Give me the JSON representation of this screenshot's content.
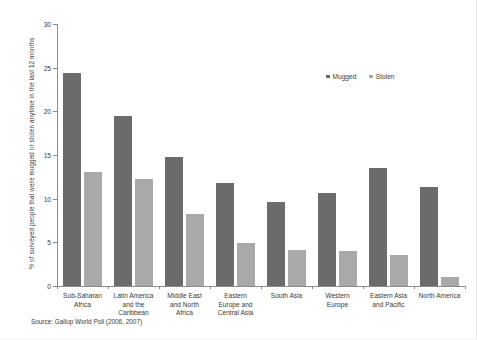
{
  "chart_data": {
    "type": "bar",
    "title": "",
    "subtitle": "",
    "xlabel": "",
    "ylabel": "% of surveyed people that were mugged or stolen anytime in the last 12 months",
    "ylim": [
      0,
      30
    ],
    "yticks": [
      0,
      5,
      10,
      15,
      20,
      25,
      30
    ],
    "ytick_labels": [
      "0",
      "5",
      "10",
      "15",
      "20",
      "25",
      "30"
    ],
    "grid": false,
    "legend_position": "top-right",
    "categories": [
      "Sub-Saharan Africa",
      "Latin America and the Caribbean",
      "Middle East and North Africa",
      "Eastern Europe and Central Asia",
      "South Asia",
      "Western Europe",
      "Eastern Asia and Pacific",
      "North America"
    ],
    "category_lines": [
      [
        "Sub-Saharan",
        "Africa"
      ],
      [
        "Latin America",
        "and the",
        "Caribbean"
      ],
      [
        "Middle East",
        "and North",
        "Africa"
      ],
      [
        "Eastern",
        "Europe and",
        "Central Asia"
      ],
      [
        "South Asia"
      ],
      [
        "Western",
        "Europe"
      ],
      [
        "Eastern Asia",
        "and Pacific"
      ],
      [
        "North America"
      ]
    ],
    "series": [
      {
        "name": "Mugged",
        "color": "#6b6b6b",
        "values": [
          24.4,
          19.5,
          14.8,
          11.8,
          9.6,
          10.7,
          13.5,
          11.3
        ]
      },
      {
        "name": "Stolen",
        "color": "#a9a9a9",
        "values": [
          13.0,
          12.2,
          8.2,
          4.9,
          4.1,
          4.0,
          3.6,
          1.0
        ]
      }
    ],
    "source": "Source: Gallup World Poll (2006, 2007)"
  },
  "legend": {
    "items": [
      {
        "label": "Mugged",
        "color": "#6b6b6b"
      },
      {
        "label": "Stolen",
        "color": "#a9a9a9"
      }
    ]
  },
  "axis": {
    "y_title": "% of surveyed people that were mugged or stolen anytime in the last 12 months"
  },
  "footer": {
    "source": "Source: Gallup World Poll (2006, 2007)"
  }
}
